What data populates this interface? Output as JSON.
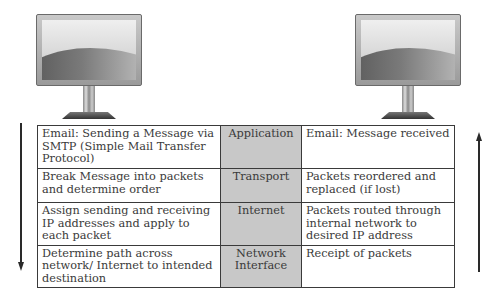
{
  "computers": [
    {
      "name": "sender-computer",
      "icon": "monitor-icon"
    },
    {
      "name": "receiver-computer",
      "icon": "monitor-icon"
    }
  ],
  "arrows": {
    "left": {
      "direction": "down",
      "icon": "arrow-down-icon"
    },
    "right": {
      "direction": "up",
      "icon": "arrow-up-icon"
    }
  },
  "layer_color": "#c8c8c8",
  "rows": [
    {
      "sender": "Email: Sending a Message via SMTP (Simple Mail Transfer Protocol)",
      "layer": "Application",
      "receiver": "Email: Message received"
    },
    {
      "sender": "Break Message into packets and determine order",
      "layer": "Transport",
      "receiver": "Packets reordered and replaced (if lost)"
    },
    {
      "sender": "Assign sending and receiving IP addresses and apply to each packet",
      "layer": "Internet",
      "receiver": "Packets routed through internal network to desired IP address"
    },
    {
      "sender": "Determine path across network/ Internet to intended destination",
      "layer": "Network Interface",
      "receiver": "Receipt of packets"
    }
  ]
}
